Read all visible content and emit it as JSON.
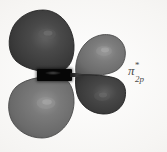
{
  "figure": {
    "kind": "molecular-orbital-diagram",
    "background_color": "#f4f3f1",
    "label": {
      "symbol": "π",
      "superscript": "*",
      "subscript": "2p",
      "full_text": "π*2p",
      "color": "#4a4a4a"
    },
    "node_bar": {
      "name": "internuclear-axis-bar",
      "color": "#060606"
    },
    "lobes": [
      {
        "id": "upper-left",
        "position": "upper-left",
        "phase": "negative",
        "shading": "dark",
        "color": "#3b3b3b",
        "highlight_color": "#5e5e5e",
        "edge_color": "#262626",
        "size": "large"
      },
      {
        "id": "lower-left",
        "position": "lower-left",
        "phase": "positive",
        "shading": "light",
        "color": "#6c6c6c",
        "highlight_color": "#8f8f8f",
        "edge_color": "#4b4b4b",
        "size": "large"
      },
      {
        "id": "upper-right",
        "position": "upper-right",
        "phase": "positive",
        "shading": "light",
        "color": "#6e6e6e",
        "highlight_color": "#909090",
        "edge_color": "#4d4d4d",
        "size": "small"
      },
      {
        "id": "lower-right",
        "position": "lower-right",
        "phase": "negative",
        "shading": "dark",
        "color": "#3a3a3a",
        "highlight_color": "#5a5a5a",
        "edge_color": "#232323",
        "size": "small"
      }
    ]
  }
}
